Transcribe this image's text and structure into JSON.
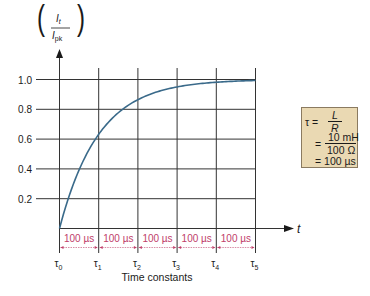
{
  "chart_data": {
    "type": "line",
    "title": "",
    "ylabel": "(I_t / I_pk)",
    "ylabel_num": "I",
    "ylabel_num_sub": "t",
    "ylabel_den": "I",
    "ylabel_den_sub": "pk",
    "xlabel": "Time constants",
    "x_axis_symbol": "t",
    "x_ticks": [
      "τ0",
      "τ1",
      "τ2",
      "τ3",
      "τ4",
      "τ5"
    ],
    "y_ticks": [
      "1.0",
      "0.8",
      "0.6",
      "0.4",
      "0.2"
    ],
    "ylim": [
      0,
      1.0
    ],
    "grid": true,
    "interval_labels": [
      "100 µs",
      "100 µs",
      "100 µs",
      "100 µs",
      "100 µs"
    ],
    "series": [
      {
        "name": "I_t/I_pk rise",
        "color": "#3a6a8a",
        "x": [
          0,
          1,
          2,
          3,
          4,
          5
        ],
        "values": [
          0.0,
          0.63,
          0.86,
          0.95,
          0.98,
          0.99
        ]
      }
    ],
    "formula": {
      "line1_lhs": "τ =",
      "line1_num": "L",
      "line1_den": "R",
      "line2_eq": "=",
      "line2_num": "10 mH",
      "line2_den": "100 Ω",
      "line3": "= 100 µs"
    }
  },
  "colors": {
    "grid": "#333333",
    "curve": "#3a6a8a",
    "interval": "#c0406a",
    "box_fill": "#ead9b3"
  }
}
